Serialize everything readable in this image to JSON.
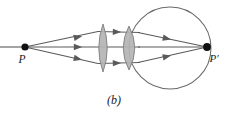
{
  "figure": {
    "caption": "(b)",
    "labels": {
      "object_point": "P",
      "image_point": "P′"
    },
    "colors": {
      "stroke": "#5a5a5a",
      "lens_fill": "#b4b4b4",
      "lens_stroke": "#8a8a8a",
      "point_fill": "#111111",
      "text": "#1a1a1a",
      "background": "#ffffff"
    },
    "geometry": {
      "object_point": {
        "x": 25,
        "y": 47,
        "r": 3.6
      },
      "image_point": {
        "x": 207,
        "y": 47,
        "r": 3.8
      },
      "optical_axis": {
        "x1": 0,
        "y1": 47,
        "x2": 207,
        "y2": 47
      },
      "eyeball_circle": {
        "cx": 170,
        "cy": 48,
        "r": 41
      },
      "lens_one": {
        "cx": 103,
        "cy": 48,
        "half_width": 7,
        "half_height": 24
      },
      "lens_two": {
        "cx": 129,
        "cy": 48,
        "half_width": 10,
        "half_height": 22
      }
    },
    "rays": [
      {
        "name": "upper-ray",
        "points": "25,47 96,32 110,32 121,32 138,33 207,47"
      },
      {
        "name": "axis-ray",
        "points": "25,47 96,47 110,47 121,47 138,47 207,47"
      },
      {
        "name": "lower-ray",
        "points": "25,47 96,63 110,63 121,63 138,62 207,47"
      }
    ],
    "arrowheads": [
      {
        "name": "arrow-upper-incident",
        "x": 80,
        "y": 33.8,
        "angle": -12
      },
      {
        "name": "arrow-axis-incident",
        "x": 80,
        "y": 47,
        "angle": 0
      },
      {
        "name": "arrow-lower-incident",
        "x": 80,
        "y": 60.4,
        "angle": 12
      },
      {
        "name": "arrow-upper-between",
        "x": 116,
        "y": 32,
        "angle": 0
      },
      {
        "name": "arrow-lower-between",
        "x": 116,
        "y": 63,
        "angle": 0
      },
      {
        "name": "arrow-upper-exit",
        "x": 166,
        "y": 38.5,
        "angle": 11
      },
      {
        "name": "arrow-lower-exit",
        "x": 166,
        "y": 57.4,
        "angle": -11
      }
    ],
    "label_positions": {
      "object_point": {
        "x": 22,
        "y": 62
      },
      "image_point": {
        "x": 212,
        "y": 61
      },
      "caption": {
        "x": 114,
        "y": 103
      }
    }
  }
}
